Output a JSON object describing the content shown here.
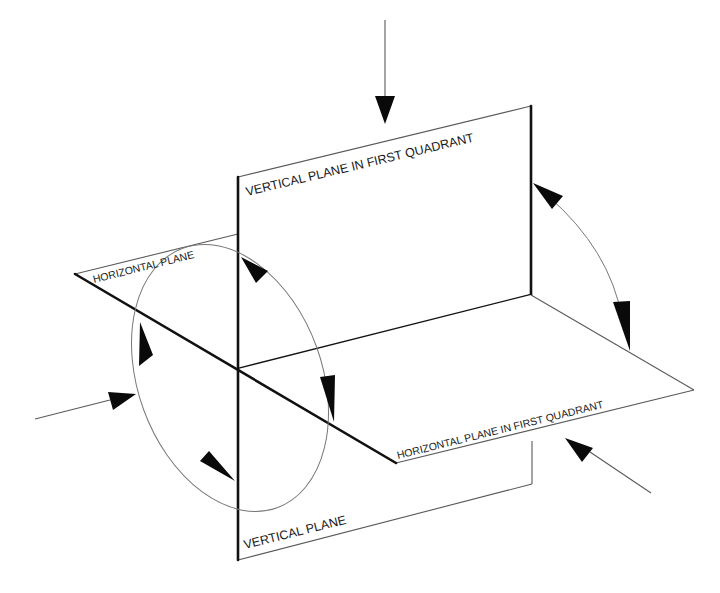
{
  "diagram": {
    "type": "projection-planes-quadrant-diagram",
    "colors": {
      "background": "#ffffff",
      "thick_line": "#111111",
      "thin_line": "#5a5a5a",
      "arc": "#777777",
      "arrowhead": "#0a0a0a",
      "text": "#1a1a1a"
    },
    "labels": {
      "vertical_plane_first_quadrant": "VERTICAL PLANE IN FIRST QUADRANT",
      "horizontal_plane": "HORIZONTAL PLANE",
      "horizontal_plane_first_quadrant": "HORIZONTAL PLANE IN FIRST QUADRANT",
      "vertical_plane": "VERTICAL PLANE"
    },
    "viewing_arrows": [
      {
        "name": "top-view-arrow",
        "direction": "down"
      },
      {
        "name": "front-view-arrow",
        "direction": "right"
      },
      {
        "name": "side-view-arrow",
        "direction": "up-left"
      }
    ],
    "rotation_arrows": [
      {
        "name": "plane-rotation-ellipse",
        "description": "elliptical arc with four arrowheads around the hinge line"
      },
      {
        "name": "first-quadrant-rotation-arc",
        "description": "double-headed arc between vertical and horizontal first-quadrant planes"
      }
    ]
  }
}
